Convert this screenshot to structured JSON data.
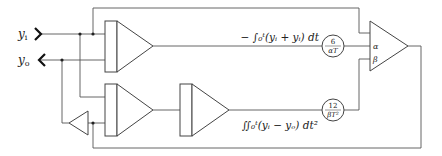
{
  "diagram": {
    "title": "",
    "ports": {
      "input_label": "y",
      "input_sub": "i",
      "output_label": "y",
      "output_sub": "o"
    },
    "formulas": {
      "top": "− ∫₀ᵗ(yᵢ + yᵢ) dt",
      "bottom": "∬₀ᵗ(yᵢ − yₒ) dt²"
    },
    "gains": {
      "alpha": {
        "num": "6",
        "den": "αT"
      },
      "beta": {
        "num": "12",
        "den": "βT²"
      }
    },
    "summer_inputs": {
      "alpha": "α",
      "beta": "β"
    },
    "blocks": [
      {
        "id": "integrator-1",
        "type": "integrator"
      },
      {
        "id": "integrator-2",
        "type": "integrator"
      },
      {
        "id": "integrator-3",
        "type": "integrator"
      },
      {
        "id": "inverter",
        "type": "inverter"
      },
      {
        "id": "summer",
        "type": "summing-amplifier"
      },
      {
        "id": "coeff-alpha",
        "type": "potentiometer"
      },
      {
        "id": "coeff-beta",
        "type": "potentiometer"
      }
    ]
  }
}
